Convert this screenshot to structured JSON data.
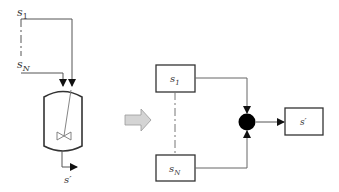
{
  "diagram": {
    "left": {
      "inlet_top_label": "s",
      "inlet_top_sub": "1",
      "inlet_bottom_label": "s",
      "inlet_bottom_sub": "N",
      "outlet_label": "s′",
      "vessel": "stirred-tank-reactor"
    },
    "transform_arrow": "block-arrow-right",
    "right": {
      "box_top_label": "s",
      "box_top_sub": "1",
      "box_bottom_label": "s",
      "box_bottom_sub": "N",
      "mixer": "mixing-node",
      "output_box_label": "s′"
    },
    "colors": {
      "line": "#555555",
      "arrow_fill": "#d4d4d4",
      "node_fill": "#000000"
    }
  }
}
